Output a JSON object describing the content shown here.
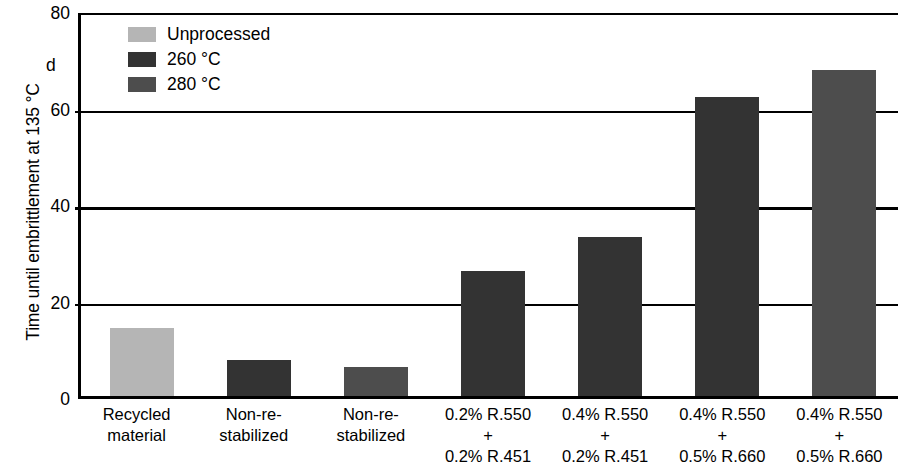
{
  "chart_data": {
    "type": "bar",
    "title": "",
    "xlabel": "",
    "ylabel": "Time until embrittlement at 135 °C",
    "yunit": "d",
    "ylim": [
      0,
      80
    ],
    "yticks": [
      80,
      60,
      40,
      20,
      0
    ],
    "grid": true,
    "legend_position": "top-left",
    "categories": [
      "Recycled material",
      "Non-re-stabilized",
      "Non-re-stabilized",
      "0.2% R.550 + 0.2% R.451",
      "0.4% R.550 + 0.2% R.451",
      "0.4% R.550 + 0.5% R.660",
      "0.4% R.550 + 0.5% R.660"
    ],
    "category_lines": [
      [
        "Recycled",
        "material"
      ],
      [
        "Non-re-",
        "stabilized"
      ],
      [
        "Non-re-",
        "stabilized"
      ],
      [
        "0.2% R.550",
        "+",
        "0.2% R.451"
      ],
      [
        "0.4% R.550",
        "+",
        "0.2% R.451"
      ],
      [
        "0.4% R.550",
        "+",
        "0.5% R.660"
      ],
      [
        "0.4% R.550",
        "+",
        "0.5% R.660"
      ]
    ],
    "values": [
      14,
      7.5,
      6,
      26,
      33,
      62,
      67.5
    ],
    "bar_series": [
      "Unprocessed",
      "260 °C",
      "280 °C",
      "260 °C",
      "260 °C",
      "260 °C",
      "280 °C"
    ],
    "series": [
      {
        "name": "Unprocessed",
        "color": "#b5b5b5"
      },
      {
        "name": "260 °C",
        "color": "#333333"
      },
      {
        "name": "280 °C",
        "color": "#4d4d4d"
      }
    ]
  },
  "legend": {
    "items": [
      {
        "label": "Unprocessed",
        "color": "#b5b5b5"
      },
      {
        "label": "260 °C",
        "color": "#333333"
      },
      {
        "label": "280 °C",
        "color": "#4d4d4d"
      }
    ]
  },
  "axis": {
    "y_title": "Time until embrittlement at 135 °C",
    "y_unit": "d",
    "y_tick_labels": [
      "80",
      "60",
      "40",
      "20",
      "0"
    ]
  }
}
